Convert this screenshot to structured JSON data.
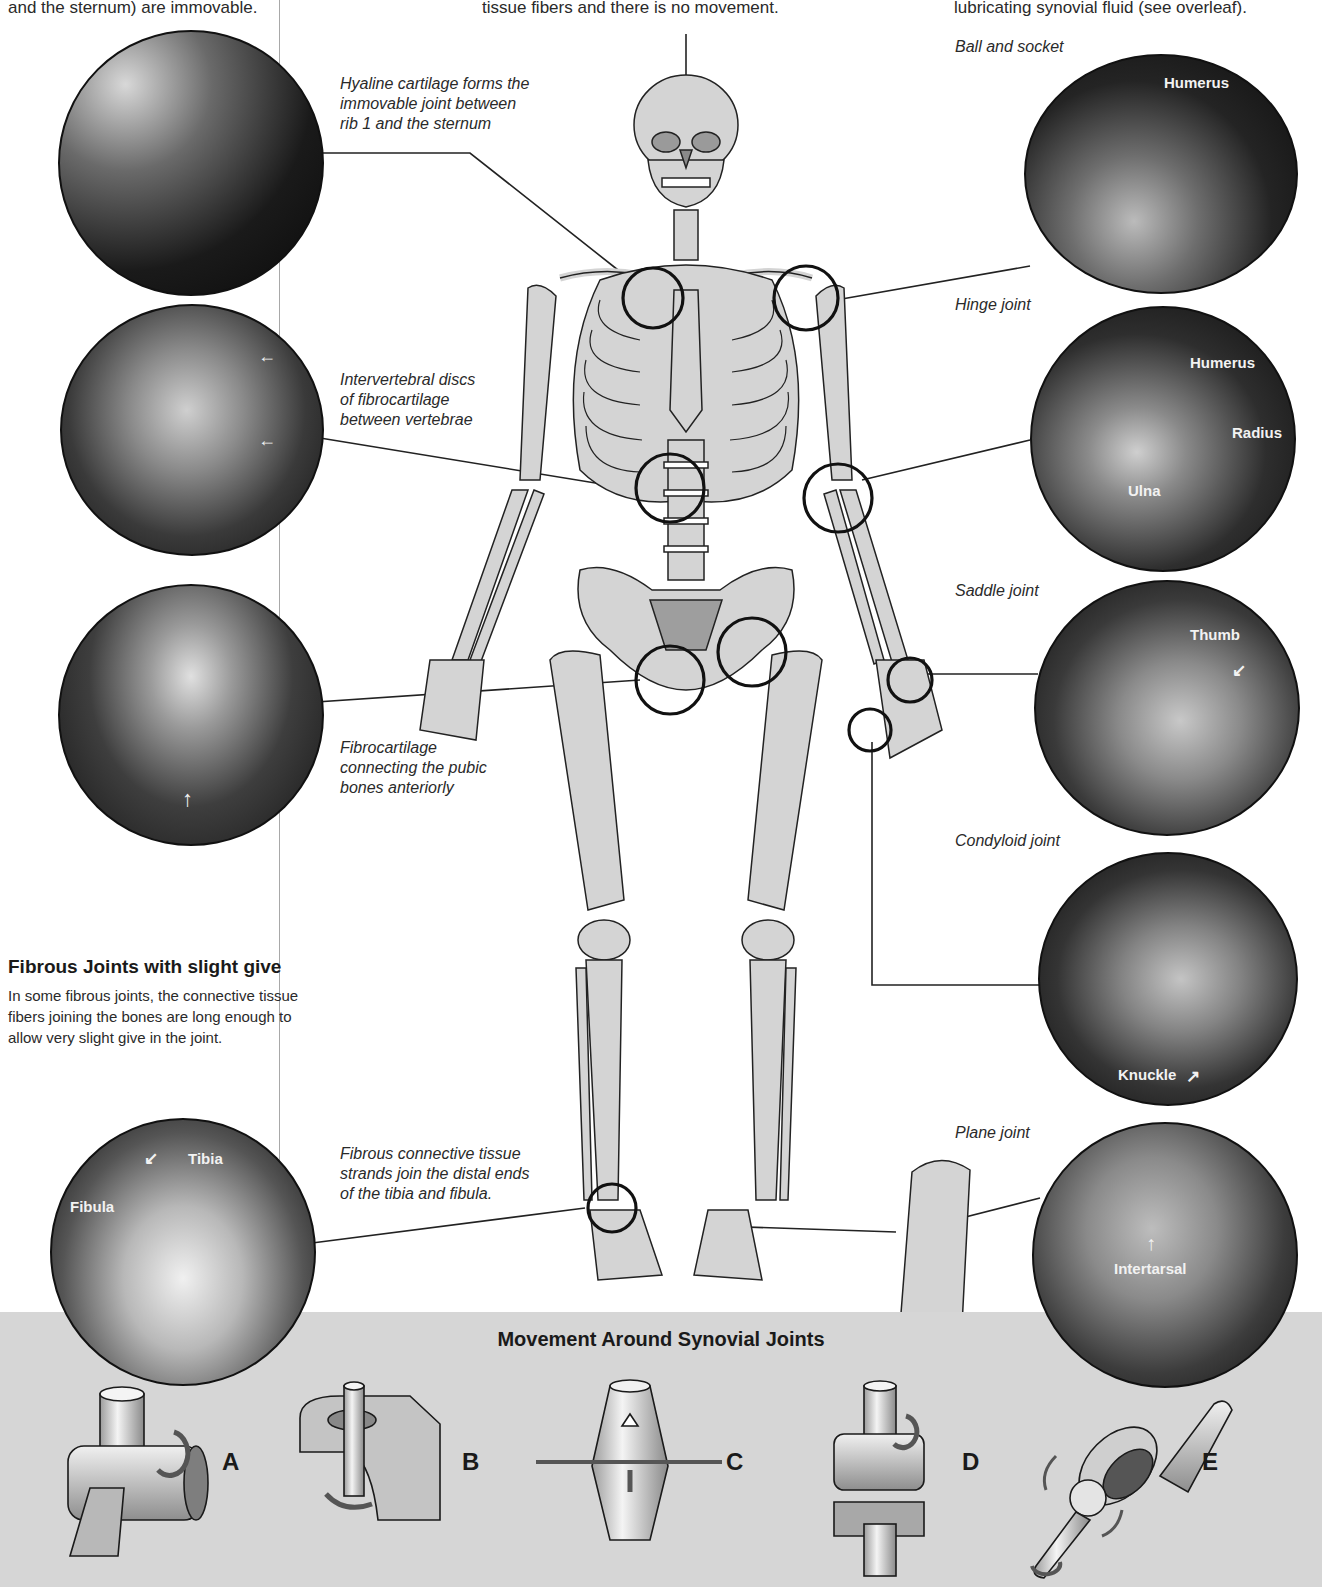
{
  "intro_text": {
    "left": "and the sternum) are immovable.",
    "center": "tissue fibers and there is no movement.",
    "right": "lubricating synovial fluid (see overleaf)."
  },
  "left_captions": {
    "hyaline": [
      "Hyaline cartilage forms the",
      "immovable joint between",
      "rib 1 and the sternum"
    ],
    "intervertebral": [
      "Intervertebral discs",
      "of fibrocartilage",
      "between vertebrae"
    ],
    "pubic": [
      "Fibrocartilage",
      "connecting the pubic",
      "bones anteriorly"
    ],
    "tibiofibular": [
      "Fibrous connective tissue",
      "strands join the distal ends",
      "of the tibia and fibula."
    ]
  },
  "fibrous_section": {
    "heading": "Fibrous Joints with slight give",
    "body": [
      "In some fibrous joints, the connective tissue",
      "fibers joining the bones are long enough to",
      "allow very slight give in the joint."
    ]
  },
  "synovial_joints": [
    {
      "title": "Ball and socket",
      "labels": [
        "Humerus"
      ]
    },
    {
      "title": "Hinge joint",
      "labels": [
        "Humerus",
        "Radius",
        "Ulna"
      ]
    },
    {
      "title": "Saddle joint",
      "labels": [
        "Thumb"
      ]
    },
    {
      "title": "Condyloid joint",
      "labels": [
        "Knuckle"
      ]
    },
    {
      "title": "Plane joint",
      "labels": [
        "Intertarsal"
      ]
    }
  ],
  "ankle_xray": {
    "labels": [
      "Tibia",
      "Fibula"
    ]
  },
  "movement_section": {
    "title": "Movement Around Synovial Joints",
    "models": [
      {
        "letter": "A"
      },
      {
        "letter": "B"
      },
      {
        "letter": "C"
      },
      {
        "letter": "D"
      },
      {
        "letter": "E"
      }
    ]
  },
  "colors": {
    "bone": "#d4d4d4",
    "outline": "#222222",
    "xray_dark": "#1a1a1a",
    "band": "#d6d6d6"
  }
}
